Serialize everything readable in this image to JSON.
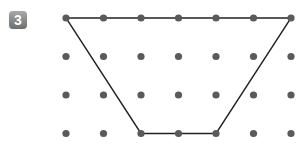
{
  "problem": {
    "number": "3"
  },
  "grid": {
    "cols": 7,
    "rows": 4,
    "x0": 66,
    "dx": 37.5,
    "y0": 18,
    "dy": 38.5,
    "dot_radius": 3.6,
    "dot_color": "#5a5a5a"
  },
  "shape": {
    "type": "trapezoid",
    "vertices_grid": [
      [
        0,
        0
      ],
      [
        6,
        0
      ],
      [
        4,
        3
      ],
      [
        2,
        3
      ]
    ],
    "stroke": "#222222",
    "stroke_width": 1.4
  }
}
